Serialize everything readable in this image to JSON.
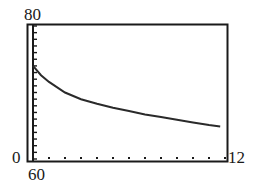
{
  "chart_data": {
    "type": "line",
    "title": "",
    "xlabel": "",
    "ylabel": "",
    "xlim": [
      0,
      12
    ],
    "ylim": [
      60,
      80
    ],
    "x_tick_spacing": 1,
    "y_tick_spacing": 1,
    "grid": false,
    "legend": null,
    "window_labels": {
      "xmin": "0",
      "xmax": "12",
      "ymin": "60",
      "ymax": "80"
    },
    "series": [
      {
        "name": "f(x)",
        "x": [
          0,
          0.5,
          1,
          2,
          3,
          4,
          5,
          6,
          7,
          8,
          9,
          10,
          11,
          11.7
        ],
        "y": [
          74.0,
          72.6,
          71.6,
          70.0,
          69.0,
          68.3,
          67.7,
          67.2,
          66.7,
          66.3,
          65.9,
          65.5,
          65.1,
          64.9
        ]
      }
    ]
  },
  "colors": {
    "frame": "#1a1a1a",
    "curve": "#2a2a2a",
    "background": "#ffffff"
  }
}
